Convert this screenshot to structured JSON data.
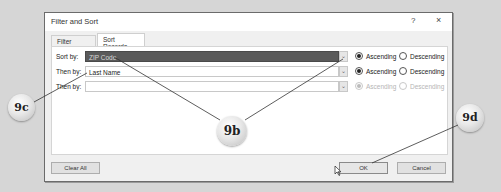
{
  "dialog": {
    "title": "Filter and Sort",
    "help_label": "?",
    "close_label": "×"
  },
  "tabs": [
    {
      "label": "Filter Records",
      "active": false
    },
    {
      "label": "Sort Records",
      "active": true
    }
  ],
  "sort_rows": [
    {
      "label": "Sort by:",
      "value": "ZIP Code",
      "selected": true,
      "ascending_label": "Ascending",
      "descending_label": "Descending",
      "order": "ascending",
      "enabled": true
    },
    {
      "label": "Then by:",
      "value": "Last Name",
      "selected": false,
      "ascending_label": "Ascending",
      "descending_label": "Descending",
      "order": "ascending",
      "enabled": true
    },
    {
      "label": "Then by:",
      "value": "",
      "selected": false,
      "ascending_label": "Ascending",
      "descending_label": "Descending",
      "order": "ascending",
      "enabled": false
    }
  ],
  "buttons": {
    "clear_all": "Clear All",
    "ok": "OK",
    "cancel": "Cancel"
  },
  "callouts": [
    {
      "id": "9c",
      "label": "9c"
    },
    {
      "id": "9b",
      "label": "9b"
    },
    {
      "id": "9d",
      "label": "9d"
    }
  ],
  "colors": {
    "selected_field_bg": "#5a5a5a",
    "background": "#d6d6d6",
    "dialog_bg": "#f0f0f0"
  }
}
